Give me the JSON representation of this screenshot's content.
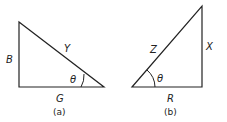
{
  "diagrams": [
    {
      "caption": "(a)",
      "angle": "θ",
      "sides": {
        "vertical": "B",
        "hypotenuse": "Y",
        "horizontal": "G"
      }
    },
    {
      "caption": "(b)",
      "angle": "θ",
      "sides": {
        "vertical": "X",
        "hypotenuse": "Z",
        "horizontal": "R"
      }
    }
  ],
  "colors": {
    "line": "#222222",
    "background": "#ffffff"
  }
}
